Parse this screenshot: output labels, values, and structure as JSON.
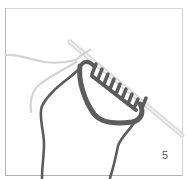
{
  "illustration": {
    "subject": "knitting-needle-with-cast-on-stitches",
    "step_number": "5",
    "colors": {
      "yarn_dark": "#5a5a5a",
      "yarn_light": "#d6d6d6",
      "needle": "#e2e2e2",
      "frame": "#bdbdbd"
    }
  }
}
